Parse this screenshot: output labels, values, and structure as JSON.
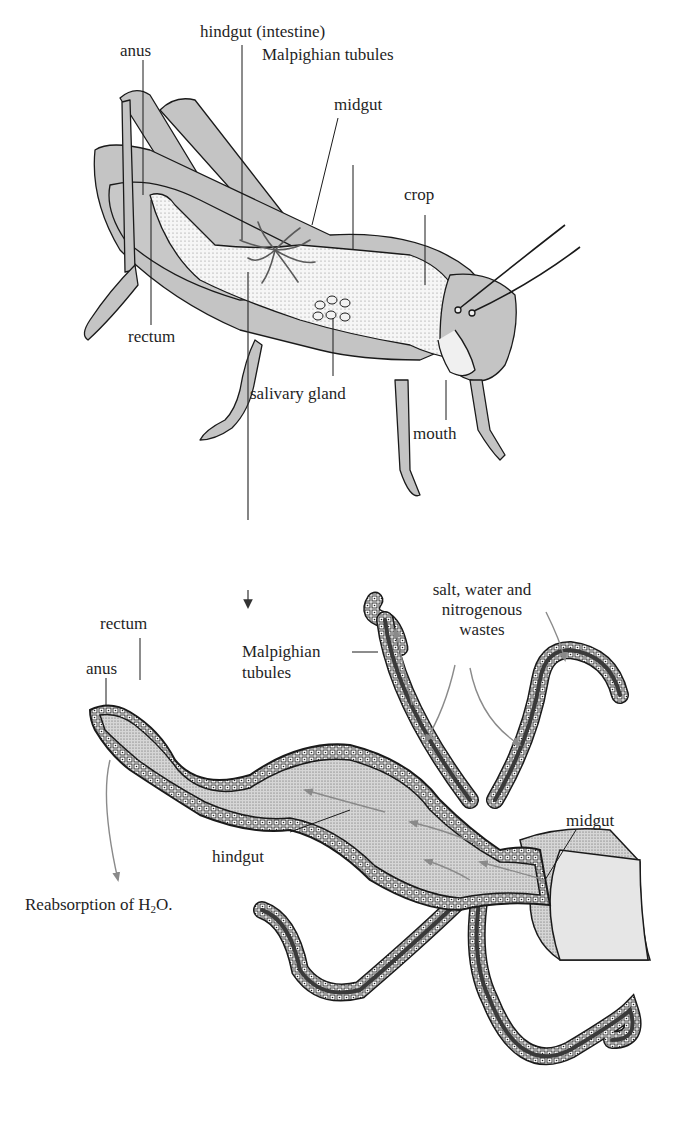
{
  "figure": {
    "top_panel": {
      "subject": "grasshopper (lateral view, cutaway)",
      "labels": {
        "anus": "anus",
        "hindgut": "hindgut (intestine)",
        "malpighian": "Malpighian tubules",
        "midgut": "midgut",
        "crop": "crop",
        "rectum": "rectum",
        "salivary_gland": "salivary gland",
        "mouth": "mouth"
      }
    },
    "bottom_panel": {
      "subject": "enlarged hindgut with Malpighian tubules",
      "labels": {
        "rectum": "rectum",
        "anus": "anus",
        "malpighian_line1": "Malpighian",
        "malpighian_line2": "tubules",
        "wastes_line1": "salt, water and",
        "wastes_line2": "nitrogenous",
        "wastes_line3": "wastes",
        "midgut": "midgut",
        "hindgut": "hindgut",
        "reabsorption_prefix": "Reabsorption of H",
        "reabsorption_sub": "2",
        "reabsorption_suffix": "O."
      }
    },
    "colors": {
      "body_fill": "#c4c4c4",
      "gut_fill": "#f4f4f4",
      "outline": "#1a1a1a",
      "tubule_color": "#5a5a5a",
      "arrow_gray": "#8a8a8a",
      "lumen_fill": "#d2d2d2"
    }
  }
}
